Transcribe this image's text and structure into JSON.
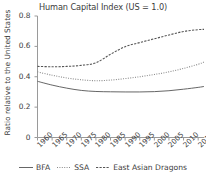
{
  "chart_data": {
    "type": "line",
    "title": "Human Capital Index (US = 1.0)",
    "xlabel": "",
    "ylabel": "Ratio relative to the United States",
    "xlim": [
      1960,
      2017
    ],
    "ylim": [
      0,
      0.8
    ],
    "grid": false,
    "legend_position": "bottom",
    "x_ticks": [
      "1960",
      "1965",
      "1970",
      "1975",
      "1980",
      "1985",
      "1990",
      "1995",
      "2000",
      "2005",
      "2010",
      "2015"
    ],
    "y_ticks": [
      "0",
      "0.2",
      "0.4",
      "0.6",
      "0.8"
    ],
    "x": [
      1960,
      1965,
      1970,
      1975,
      1980,
      1985,
      1990,
      1995,
      2000,
      2005,
      2010,
      2015,
      2017
    ],
    "series": [
      {
        "name": "BFA",
        "style": "solid",
        "color": "#555555",
        "values": [
          0.37,
          0.345,
          0.325,
          0.31,
          0.303,
          0.301,
          0.3,
          0.3,
          0.302,
          0.308,
          0.318,
          0.33,
          0.336
        ]
      },
      {
        "name": "SSA",
        "style": "dotted",
        "color": "#8a8a8a",
        "values": [
          0.432,
          0.41,
          0.392,
          0.38,
          0.374,
          0.378,
          0.388,
          0.4,
          0.415,
          0.432,
          0.455,
          0.482,
          0.497
        ]
      },
      {
        "name": "East Asian Dragons",
        "style": "dashed",
        "color": "#555555",
        "values": [
          0.468,
          0.466,
          0.468,
          0.475,
          0.492,
          0.548,
          0.598,
          0.625,
          0.65,
          0.675,
          0.698,
          0.71,
          0.712
        ]
      }
    ]
  },
  "legend": {
    "items": [
      {
        "label": "BFA"
      },
      {
        "label": "SSA"
      },
      {
        "label": "East Asian Dragons"
      }
    ]
  }
}
